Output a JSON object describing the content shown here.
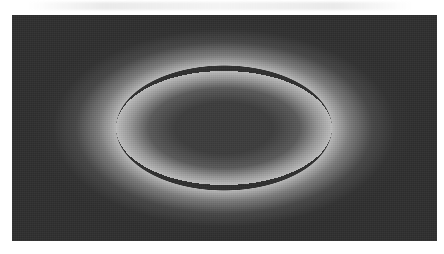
{
  "image": {
    "description": "Grayscale image of a bright elliptical ring on a dark background",
    "colors": {
      "page_background": "#ffffff",
      "image_background": "#2e2e2e",
      "ring_center_fill": "#3a3a3a",
      "ring_peak": "#bdbdbd"
    },
    "ring": {
      "center_x": 224,
      "center_y": 128,
      "radius_x": 108,
      "radius_y": 57
    }
  }
}
